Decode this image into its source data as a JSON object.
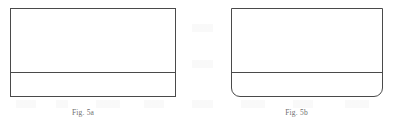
{
  "page": {
    "background_color": "#ffffff",
    "line_color": "#4a4a4a",
    "width": 401,
    "height": 119
  },
  "figures": [
    {
      "id": "figure-left",
      "shape_name": "rectangular-box-square-corners",
      "corner_style": "square",
      "has_bottom_divider": true,
      "caption": "Fig. 5a",
      "caption_clipped": true,
      "box": {
        "x": 10,
        "y": 8,
        "width": 166,
        "height": 89,
        "divider_y": 71
      }
    },
    {
      "id": "figure-right",
      "shape_name": "rectangular-box-rounded-bottom-corners",
      "corner_style": "rounded-bottom",
      "has_bottom_divider": true,
      "caption": "Fig. 5b",
      "caption_clipped": true,
      "box": {
        "x": 231,
        "y": 8,
        "width": 152,
        "height": 89,
        "divider_y": 71
      }
    }
  ]
}
